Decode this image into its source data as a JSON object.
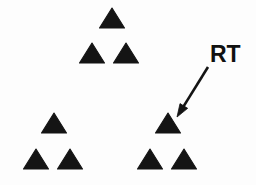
{
  "figure": {
    "background_color": "#fdfdfd",
    "ink_color": "#141414",
    "width": 256,
    "height": 185,
    "shape_name": "triangle",
    "shape_count": 9,
    "cluster_count": 3
  },
  "annotation": {
    "label_text": "RT",
    "label_x": 210,
    "label_y": 43,
    "label_font_size": 23,
    "label_color": "#111111",
    "arrow": {
      "name": "pointer-arrow",
      "tail_x": 208,
      "tail_y": 67,
      "tip_x": 177,
      "tip_y": 117,
      "color": "#141414",
      "stroke_width": 2.6,
      "head_length": 13,
      "head_width": 9
    }
  },
  "clusters": [
    {
      "name": "top-cluster",
      "label": "top",
      "triangles": [
        {
          "name": "triangle-top-apex",
          "cx": 112,
          "cy": 28,
          "width": 25,
          "height": 20
        },
        {
          "name": "triangle-top-left",
          "cx": 92,
          "cy": 63,
          "width": 25,
          "height": 20
        },
        {
          "name": "triangle-top-right",
          "cx": 126,
          "cy": 63,
          "width": 25,
          "height": 20
        }
      ]
    },
    {
      "name": "bottom-left-cluster",
      "label": "bottom left",
      "triangles": [
        {
          "name": "triangle-bl-apex",
          "cx": 54,
          "cy": 133,
          "width": 25,
          "height": 20
        },
        {
          "name": "triangle-bl-left",
          "cx": 36,
          "cy": 169,
          "width": 25,
          "height": 20
        },
        {
          "name": "triangle-bl-right",
          "cx": 70,
          "cy": 169,
          "width": 25,
          "height": 20
        }
      ]
    },
    {
      "name": "bottom-right-cluster",
      "label": "bottom right",
      "triangles": [
        {
          "name": "triangle-br-apex-rt-target",
          "cx": 168,
          "cy": 133,
          "width": 25,
          "height": 20,
          "annotated": true
        },
        {
          "name": "triangle-br-left",
          "cx": 150,
          "cy": 169,
          "width": 25,
          "height": 20
        },
        {
          "name": "triangle-br-right",
          "cx": 184,
          "cy": 169,
          "width": 25,
          "height": 20
        }
      ]
    }
  ]
}
